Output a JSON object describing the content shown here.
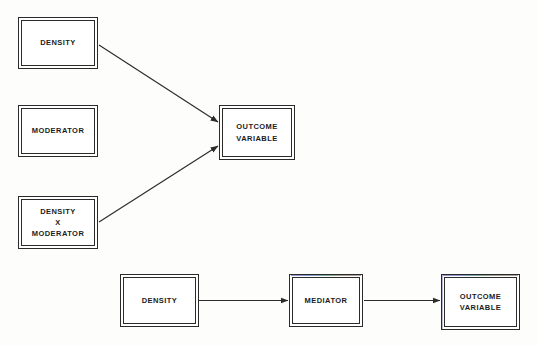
{
  "diagram": {
    "background_color": "#fdfdfc",
    "line_color": "#2b2b2b",
    "text_color": "#1c1c1c",
    "models": [
      {
        "name": "moderation-model",
        "nodes": [
          {
            "id": "density-top",
            "label": "DENSITY"
          },
          {
            "id": "moderator",
            "label": "MODERATOR"
          },
          {
            "id": "density-x-moderator",
            "label": "DENSITY\nX\nMODERATOR"
          },
          {
            "id": "outcome-variable-top",
            "label": "OUTCOME\nVARIABLE"
          }
        ],
        "edges": [
          {
            "from": "DENSITY",
            "to": "OUTCOME VARIABLE",
            "style": "solid-arrow"
          },
          {
            "from": "DENSITY X MODERATOR",
            "to": "OUTCOME VARIABLE",
            "style": "solid-arrow"
          }
        ]
      },
      {
        "name": "mediation-model",
        "nodes": [
          {
            "id": "density-bottom",
            "label": "DENSITY"
          },
          {
            "id": "mediator",
            "label": "MEDIATOR"
          },
          {
            "id": "outcome-variable-bottom",
            "label": "OUTCOME\nVARIABLE"
          }
        ],
        "edges": [
          {
            "from": "DENSITY",
            "to": "MEDIATOR",
            "style": "solid-arrow"
          },
          {
            "from": "MEDIATOR",
            "to": "OUTCOME VARIABLE",
            "style": "solid-arrow"
          }
        ]
      }
    ]
  },
  "labels": {
    "density_top": "DENSITY",
    "moderator": "MODERATOR",
    "density_x_moderator": "DENSITY\nX\nMODERATOR",
    "outcome_variable_top": "OUTCOME\nVARIABLE",
    "density_bottom": "DENSITY",
    "mediator": "MEDIATOR",
    "outcome_variable_bottom": "OUTCOME\nVARIABLE"
  }
}
